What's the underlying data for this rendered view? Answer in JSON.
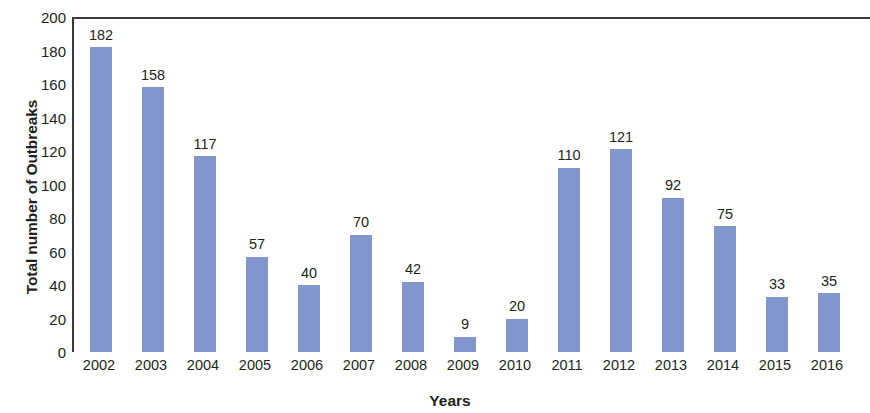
{
  "chart_data": {
    "type": "bar",
    "title": "",
    "subtitle": "",
    "xlabel": "Years",
    "ylabel": "Total number of Outbreaks",
    "categories": [
      "2002",
      "2003",
      "2004",
      "2005",
      "2006",
      "2007",
      "2008",
      "2009",
      "2010",
      "2011",
      "2012",
      "2013",
      "2014",
      "2015",
      "2016"
    ],
    "values": [
      182,
      158,
      117,
      57,
      40,
      70,
      42,
      9,
      20,
      110,
      121,
      92,
      75,
      33,
      35
    ],
    "series": [
      {
        "name": "Total number of Outbreaks",
        "values": [
          182,
          158,
          117,
          57,
          40,
          70,
          42,
          9,
          20,
          110,
          121,
          92,
          75,
          33,
          35
        ]
      }
    ],
    "data_labels": [
      "182",
      "158",
      "117",
      "57",
      "40",
      "70",
      "42",
      "9",
      "20",
      "110",
      "121",
      "92",
      "75",
      "33",
      "35"
    ],
    "ylim": [
      0,
      200
    ],
    "y_ticks": [
      0,
      20,
      40,
      60,
      80,
      100,
      120,
      140,
      160,
      180,
      200
    ],
    "y_tick_labels": [
      "0",
      "20",
      "40",
      "60",
      "80",
      "100",
      "120",
      "140",
      "160",
      "180",
      "200"
    ],
    "grid": false,
    "legend": false,
    "legend_position": "none",
    "bar_color": "#8096cc",
    "axis_color": "#3a3a3a",
    "text_color": "#231f20",
    "background_color": "#ffffff"
  }
}
